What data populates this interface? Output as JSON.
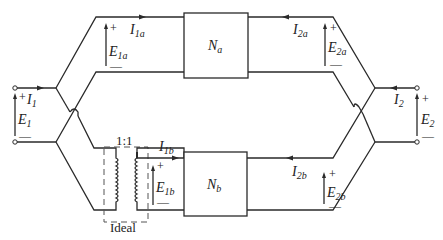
{
  "figure": {
    "type": "two-port parallel connection with ideal transformer",
    "networks": [
      {
        "id": "Na",
        "label": "N",
        "subscript": "a"
      },
      {
        "id": "Nb",
        "label": "N",
        "subscript": "b"
      }
    ],
    "port1": {
      "current": {
        "label": "I",
        "subscript": "1"
      },
      "voltage": {
        "label": "E",
        "subscript": "1",
        "plus": "+",
        "minus": "—"
      }
    },
    "port2": {
      "current": {
        "label": "I",
        "subscript": "2"
      },
      "voltage": {
        "label": "E",
        "subscript": "2",
        "plus": "+",
        "minus": "—"
      }
    },
    "branch_a": {
      "I1": {
        "label": "I",
        "subscript": "1a"
      },
      "E1": {
        "label": "E",
        "subscript": "1a",
        "plus": "+",
        "minus": "—"
      },
      "I2": {
        "label": "I",
        "subscript": "2a"
      },
      "E2": {
        "label": "E",
        "subscript": "2a",
        "plus": "+",
        "minus": "—"
      }
    },
    "branch_b": {
      "I1": {
        "label": "I",
        "subscript": "1b"
      },
      "E1": {
        "label": "E",
        "subscript": "1b",
        "plus": "+",
        "minus": "—"
      },
      "I2": {
        "label": "I",
        "subscript": "2b"
      },
      "E2": {
        "label": "E",
        "subscript": "2b",
        "plus": "+",
        "minus": "—"
      }
    },
    "transformer": {
      "ratio": "1:1",
      "caption": "Ideal"
    }
  }
}
